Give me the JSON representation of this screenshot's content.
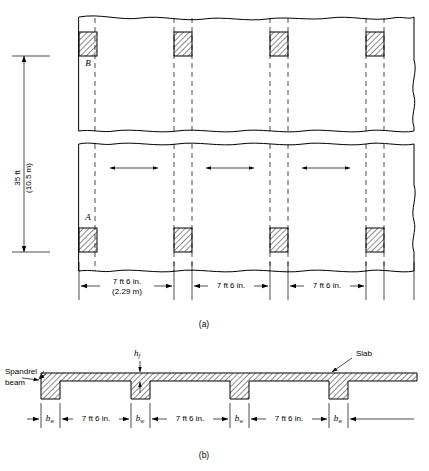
{
  "figure": {
    "captions": {
      "plan": "(a)",
      "section": "(b)"
    }
  },
  "plan": {
    "vertical_dimension": {
      "line1": "35 ft",
      "line2": "(10.5 m)"
    },
    "grid_letters": [
      "B",
      "A"
    ],
    "bay_dimensions": [
      {
        "line1": "7 ft 6 in.",
        "line2": "(2.29 m)"
      },
      {
        "line1": "7 ft 6 in.",
        "line2": ""
      },
      {
        "line1": "7 ft 6 in.",
        "line2": ""
      }
    ],
    "column_count_per_row": 4,
    "span_arrow_count": 3
  },
  "section": {
    "labels": {
      "spandrel_line1": "Spandrel",
      "spandrel_line2": "beam",
      "slab": "Slab",
      "slab_thickness_symbol": "h",
      "slab_thickness_subscript": "f",
      "web_width_symbol": "b",
      "web_width_subscript": "w"
    },
    "web_labels": [
      "b",
      "b",
      "b",
      "b"
    ],
    "bay_dimensions": [
      "7 ft 6 in.",
      "7 ft 6 in.",
      "7 ft 6 in."
    ]
  },
  "colors": {
    "line": "#000000",
    "background": "#ffffff",
    "hatch": "#000000"
  }
}
